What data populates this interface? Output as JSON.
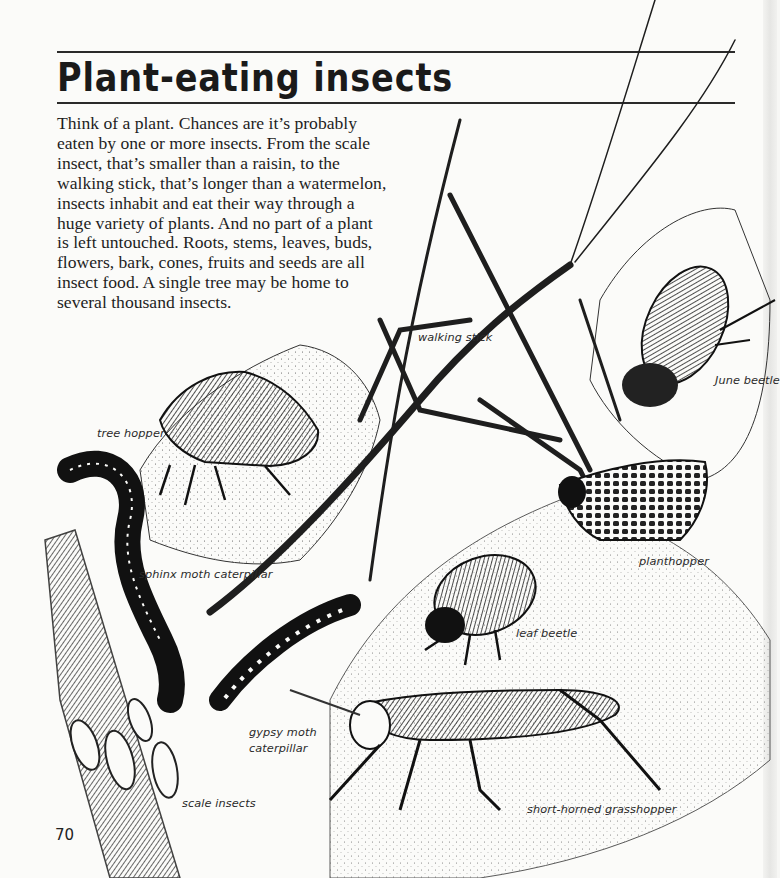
{
  "page": {
    "title": "Plant-eating insects",
    "page_number": "70",
    "body_lines": [
      "Think of a plant. Chances are it’s probably",
      "eaten by one or more insects. From the scale",
      "insect, that’s smaller than a raisin, to the",
      "walking stick, that’s longer than a watermelon,",
      "insects inhabit and eat their way through a",
      "huge variety of plants. And no part of a plant",
      "is left untouched. Roots, stems, leaves, buds,",
      "flowers, bark, cones, fruits and seeds are all",
      "insect food. A single tree may be home to",
      "several thousand insects."
    ]
  },
  "illustration": {
    "labels": {
      "walking_stick": "walking stick",
      "june_beetle": "June beetle",
      "tree_hopper": "tree hopper",
      "sphinx_moth_caterpillar": "sphinx moth caterpillar",
      "planthopper": "planthopper",
      "leaf_beetle": "leaf beetle",
      "gypsy_moth_caterpillar_line1": "gypsy moth",
      "gypsy_moth_caterpillar_line2": "caterpillar",
      "scale_insects": "scale insects",
      "short_horned_grasshopper": "short-horned grasshopper"
    }
  }
}
